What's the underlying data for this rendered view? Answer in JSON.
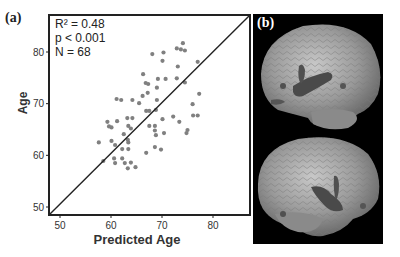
{
  "figure": {
    "panel_a_label": "(a)",
    "panel_b_label": "(b)"
  },
  "stats": {
    "r2": "R² = 0.48",
    "p": "p < 0.001",
    "n": "N = 68"
  },
  "chart_data": {
    "type": "scatter",
    "title": "",
    "xlabel": "Predicted Age",
    "ylabel": "Age",
    "xlim": [
      48,
      87
    ],
    "ylim": [
      48,
      86
    ],
    "xticks": [
      50,
      60,
      70,
      80
    ],
    "yticks": [
      50,
      60,
      70,
      80
    ],
    "grid": false,
    "legend": null,
    "annotations": [
      "R² = 0.48",
      "p < 0.001",
      "N = 68"
    ],
    "reference_line": {
      "type": "identity",
      "from": [
        48,
        48
      ],
      "to": [
        87,
        87
      ],
      "color": "#222222"
    },
    "point_color": "#808080",
    "points": [
      {
        "x": 74.1,
        "y": 81.7
      },
      {
        "x": 72.9,
        "y": 80.7
      },
      {
        "x": 73.7,
        "y": 80.5
      },
      {
        "x": 74.5,
        "y": 80.3
      },
      {
        "x": 68.1,
        "y": 79.6
      },
      {
        "x": 70.3,
        "y": 79.9
      },
      {
        "x": 70.1,
        "y": 78.3
      },
      {
        "x": 77.0,
        "y": 78.1
      },
      {
        "x": 73.1,
        "y": 77.2
      },
      {
        "x": 66.3,
        "y": 75.7
      },
      {
        "x": 69.2,
        "y": 74.8
      },
      {
        "x": 70.7,
        "y": 74.8
      },
      {
        "x": 72.9,
        "y": 74.9
      },
      {
        "x": 66.8,
        "y": 74.0
      },
      {
        "x": 67.3,
        "y": 73.8
      },
      {
        "x": 74.5,
        "y": 74.1
      },
      {
        "x": 69.0,
        "y": 73.1
      },
      {
        "x": 67.2,
        "y": 72.1
      },
      {
        "x": 77.3,
        "y": 71.9
      },
      {
        "x": 66.2,
        "y": 71.5
      },
      {
        "x": 61.1,
        "y": 70.9
      },
      {
        "x": 62.0,
        "y": 70.7
      },
      {
        "x": 64.2,
        "y": 70.7
      },
      {
        "x": 65.5,
        "y": 70.1
      },
      {
        "x": 69.0,
        "y": 70.7
      },
      {
        "x": 76.0,
        "y": 69.9
      },
      {
        "x": 66.9,
        "y": 68.6
      },
      {
        "x": 67.5,
        "y": 68.6
      },
      {
        "x": 68.8,
        "y": 68.8
      },
      {
        "x": 76.1,
        "y": 67.7
      },
      {
        "x": 77.0,
        "y": 67.7
      },
      {
        "x": 59.3,
        "y": 66.5
      },
      {
        "x": 61.2,
        "y": 66.6
      },
      {
        "x": 63.2,
        "y": 67.2
      },
      {
        "x": 64.2,
        "y": 67.2
      },
      {
        "x": 70.1,
        "y": 67.0
      },
      {
        "x": 72.2,
        "y": 67.5
      },
      {
        "x": 73.4,
        "y": 66.5
      },
      {
        "x": 59.6,
        "y": 65.6
      },
      {
        "x": 60.1,
        "y": 65.4
      },
      {
        "x": 63.4,
        "y": 65.7
      },
      {
        "x": 63.9,
        "y": 65.2
      },
      {
        "x": 67.5,
        "y": 65.7
      },
      {
        "x": 68.6,
        "y": 65.7
      },
      {
        "x": 68.6,
        "y": 64.8
      },
      {
        "x": 68.8,
        "y": 63.9
      },
      {
        "x": 70.4,
        "y": 64.3
      },
      {
        "x": 75.0,
        "y": 64.9
      },
      {
        "x": 74.8,
        "y": 64.3
      },
      {
        "x": 62.5,
        "y": 64.1
      },
      {
        "x": 63.3,
        "y": 63.0
      },
      {
        "x": 57.6,
        "y": 62.5
      },
      {
        "x": 60.1,
        "y": 62.8
      },
      {
        "x": 60.8,
        "y": 62.0
      },
      {
        "x": 63.4,
        "y": 62.5
      },
      {
        "x": 62.2,
        "y": 61.2
      },
      {
        "x": 63.4,
        "y": 61.2
      },
      {
        "x": 68.6,
        "y": 61.6
      },
      {
        "x": 69.8,
        "y": 61.1
      },
      {
        "x": 66.9,
        "y": 60.5
      },
      {
        "x": 58.5,
        "y": 58.9
      },
      {
        "x": 60.6,
        "y": 59.4
      },
      {
        "x": 60.8,
        "y": 58.5
      },
      {
        "x": 62.2,
        "y": 59.4
      },
      {
        "x": 62.7,
        "y": 58.5
      },
      {
        "x": 63.3,
        "y": 57.5
      },
      {
        "x": 63.9,
        "y": 58.6
      },
      {
        "x": 64.8,
        "y": 57.7
      }
    ]
  },
  "brain_panel": {
    "views": [
      "lateral brain surface with highlighted region (top)",
      "lateral brain surface with highlighted region (bottom)"
    ],
    "background": "#000000",
    "surface_color": "#a8a8a8",
    "highlight_color": "#4a4a4a"
  }
}
